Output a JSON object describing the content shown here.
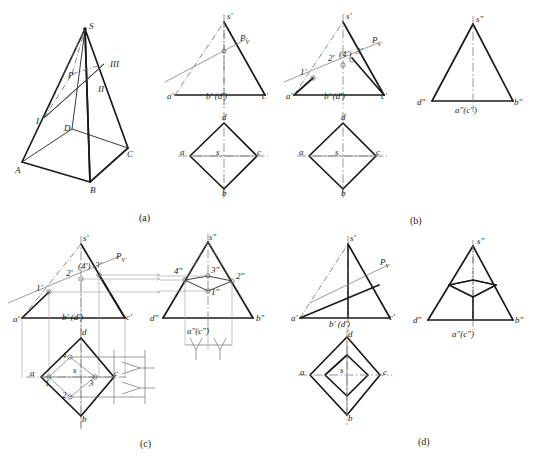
{
  "figure": {
    "panels": [
      {
        "id": "a",
        "caption": "(a)",
        "x": 139,
        "y": 212
      },
      {
        "id": "b",
        "caption": "(b)",
        "x": 410,
        "y": 215
      },
      {
        "id": "c",
        "caption": "(c)",
        "x": 140,
        "y": 438
      },
      {
        "id": "d",
        "caption": "(d)",
        "x": 418,
        "y": 436
      }
    ],
    "colors": {
      "outline": "#1a1a1a",
      "thin": "#555555",
      "projection": "#8c8c8c",
      "centerline": "#666666"
    }
  },
  "panel_a": {
    "name": "pictorial-pyramid",
    "labels": [
      {
        "text": "S",
        "x": 89,
        "y": 22
      },
      {
        "text": "III",
        "x": 110,
        "y": 60
      },
      {
        "text": "II",
        "x": 98,
        "y": 85
      },
      {
        "text": "I",
        "x": 36,
        "y": 117
      },
      {
        "text": "P",
        "x": 68,
        "y": 71
      },
      {
        "text": "D",
        "x": 64,
        "y": 124
      },
      {
        "text": "A",
        "x": 17,
        "y": 168
      },
      {
        "text": "B",
        "x": 90,
        "y": 188
      },
      {
        "text": "C",
        "x": 125,
        "y": 155
      }
    ]
  },
  "panel_b1": {
    "name": "front-view-plane-trace",
    "labels": [
      {
        "text": "s'",
        "x": 226,
        "y": 13
      },
      {
        "text": "P",
        "x": 239,
        "y": 39,
        "sub": "V"
      },
      {
        "text": "a'",
        "x": 182,
        "y": 97
      },
      {
        "text": "b' (d')",
        "x": 206,
        "y": 97
      },
      {
        "text": "c'",
        "x": 257,
        "y": 97
      }
    ],
    "top_labels": [
      {
        "text": "d",
        "x": 222,
        "y": 119
      },
      {
        "text": "a",
        "x": 182,
        "y": 152
      },
      {
        "text": "s",
        "x": 221,
        "y": 152
      },
      {
        "text": "c",
        "x": 255,
        "y": 152
      },
      {
        "text": "b",
        "x": 222,
        "y": 193
      }
    ]
  },
  "panel_b2": {
    "name": "front-view-intersection-points",
    "labels": [
      {
        "text": "s'",
        "x": 345,
        "y": 13
      },
      {
        "text": "P",
        "x": 369,
        "y": 40,
        "sub": "V"
      },
      {
        "text": "1'",
        "x": 296,
        "y": 70
      },
      {
        "text": "2'",
        "x": 322,
        "y": 56
      },
      {
        "text": "(4')",
        "x": 334,
        "y": 53
      },
      {
        "text": "3'",
        "x": 349,
        "y": 51
      },
      {
        "text": "a'",
        "x": 298,
        "y": 97
      },
      {
        "text": "b' (d')",
        "x": 324,
        "y": 97
      },
      {
        "text": "c'",
        "x": 374,
        "y": 97
      }
    ],
    "top_labels": [
      {
        "text": "d",
        "x": 340,
        "y": 119
      },
      {
        "text": "a",
        "x": 300,
        "y": 152
      },
      {
        "text": "s",
        "x": 340,
        "y": 152
      },
      {
        "text": "c",
        "x": 373,
        "y": 152
      },
      {
        "text": "b",
        "x": 340,
        "y": 193
      }
    ]
  },
  "panel_b3": {
    "name": "side-view-pyramid",
    "labels": [
      {
        "text": "s\"",
        "x": 476,
        "y": 17
      },
      {
        "text": "d\"",
        "x": 424,
        "y": 103
      },
      {
        "text": "b\"",
        "x": 508,
        "y": 103
      },
      {
        "text": "a\"(c\")",
        "x": 455,
        "y": 112
      }
    ]
  },
  "panel_c1": {
    "name": "front-view-projection-construction",
    "labels": [
      {
        "text": "s'",
        "x": 74,
        "y": 235
      },
      {
        "text": "P",
        "x": 116,
        "y": 261,
        "sub": "V"
      },
      {
        "text": "1'",
        "x": 40,
        "y": 292
      },
      {
        "text": "2'",
        "x": 68,
        "y": 277
      },
      {
        "text": "(4')",
        "x": 78,
        "y": 269
      },
      {
        "text": "3'",
        "x": 94,
        "y": 267
      },
      {
        "text": "a'",
        "x": 27,
        "y": 321
      },
      {
        "text": "b' (d')",
        "x": 64,
        "y": 319
      },
      {
        "text": "c'",
        "x": 117,
        "y": 319
      }
    ],
    "top_labels": [
      {
        "text": "d",
        "x": 80,
        "y": 334
      },
      {
        "text": "4",
        "x": 70,
        "y": 358
      },
      {
        "text": "a",
        "x": 31,
        "y": 378
      },
      {
        "text": "s",
        "x": 79,
        "y": 373
      },
      {
        "text": "3",
        "x": 92,
        "y": 383
      },
      {
        "text": "1",
        "x": 44,
        "y": 385
      },
      {
        "text": "c",
        "x": 111,
        "y": 377
      },
      {
        "text": "2",
        "x": 70,
        "y": 398
      },
      {
        "text": "b",
        "x": 80,
        "y": 421
      }
    ]
  },
  "panel_c2": {
    "name": "side-view-projection-construction",
    "labels": [
      {
        "text": "s\"",
        "x": 205,
        "y": 234
      },
      {
        "text": "4\"",
        "x": 177,
        "y": 274
      },
      {
        "text": "3\"",
        "x": 207,
        "y": 272
      },
      {
        "text": "2\"",
        "x": 232,
        "y": 279
      },
      {
        "text": "1\"",
        "x": 206,
        "y": 296
      },
      {
        "text": "d\"",
        "x": 155,
        "y": 320
      },
      {
        "text": "b\"",
        "x": 254,
        "y": 320
      },
      {
        "text": "a\"(c\")",
        "x": 188,
        "y": 333
      }
    ]
  },
  "panel_d1": {
    "name": "front-view-result",
    "labels": [
      {
        "text": "s'",
        "x": 351,
        "y": 235
      },
      {
        "text": "P",
        "x": 379,
        "y": 264,
        "sub": "V"
      },
      {
        "text": "a'",
        "x": 304,
        "y": 320
      },
      {
        "text": "b' (d')",
        "x": 334,
        "y": 320
      },
      {
        "text": "c'",
        "x": 384,
        "y": 319
      }
    ],
    "top_labels": [
      {
        "text": "d",
        "x": 347,
        "y": 340
      },
      {
        "text": "a",
        "x": 305,
        "y": 375
      },
      {
        "text": "s",
        "x": 345,
        "y": 375
      },
      {
        "text": "c",
        "x": 381,
        "y": 375
      },
      {
        "text": "b",
        "x": 347,
        "y": 420
      }
    ]
  },
  "panel_d2": {
    "name": "side-view-result",
    "labels": [
      {
        "text": "s\"",
        "x": 477,
        "y": 239
      },
      {
        "text": "d\"",
        "x": 419,
        "y": 322
      },
      {
        "text": "b\"",
        "x": 508,
        "y": 322
      },
      {
        "text": "a\"(c\")",
        "x": 452,
        "y": 336
      }
    ]
  }
}
